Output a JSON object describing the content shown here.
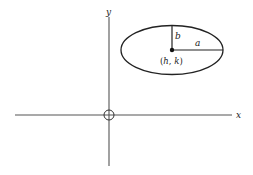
{
  "figure": {
    "axes": {
      "x_label": "x",
      "y_label": "y",
      "origin_marker": "circle"
    },
    "ellipse": {
      "center_label": "(h, k)",
      "center_h": "h",
      "center_k": "k",
      "semi_major_label": "a",
      "semi_minor_label": "b"
    },
    "colors": {
      "stroke": "#222222",
      "axis": "#555555",
      "background": "#ffffff"
    }
  }
}
